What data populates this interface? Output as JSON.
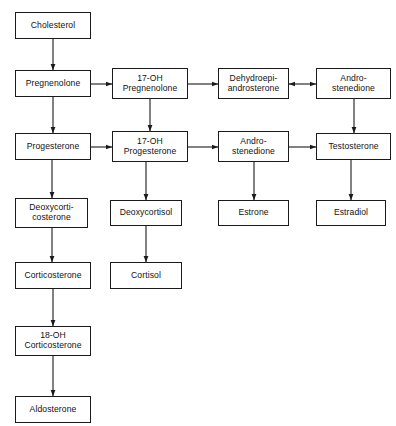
{
  "diagram": {
    "type": "flowchart",
    "canvas": {
      "width": 396,
      "height": 426
    },
    "style": {
      "background": "#ffffff",
      "box_border": "#1a1a1a",
      "box_fill": "#ffffff",
      "text_color": "#111111",
      "arrow_color": "#1a1a1a"
    },
    "nodes": [
      {
        "id": "cholesterol",
        "label": "Cholesterol",
        "x": 15,
        "y": 12,
        "w": 76,
        "h": 27
      },
      {
        "id": "pregnenolone",
        "label": "Pregnenolone",
        "x": 15,
        "y": 70,
        "w": 76,
        "h": 27
      },
      {
        "id": "oh17_pregnenolone",
        "label": "17-OH\nPregnenolone",
        "x": 112,
        "y": 68,
        "w": 76,
        "h": 31
      },
      {
        "id": "dhea",
        "label": "Dehydroepi-\nandrosterone",
        "x": 218,
        "y": 68,
        "w": 71,
        "h": 31
      },
      {
        "id": "androstenedione_top",
        "label": "Andro-\nstenedione",
        "x": 316,
        "y": 68,
        "w": 75,
        "h": 31
      },
      {
        "id": "progesterone",
        "label": "Progesterone",
        "x": 15,
        "y": 133,
        "w": 76,
        "h": 27
      },
      {
        "id": "oh17_progesterone",
        "label": "17-OH\nProgesterone",
        "x": 112,
        "y": 131,
        "w": 76,
        "h": 31
      },
      {
        "id": "androstenedione_mid",
        "label": "Andro-\nstenedione",
        "x": 218,
        "y": 131,
        "w": 71,
        "h": 31
      },
      {
        "id": "testosterone",
        "label": "Testosterone",
        "x": 316,
        "y": 133,
        "w": 75,
        "h": 27
      },
      {
        "id": "deoxycorticosterone",
        "label": "Deoxycorti-\ncosterone",
        "x": 15,
        "y": 198,
        "w": 73,
        "h": 30
      },
      {
        "id": "deoxycortisol",
        "label": "Deoxycortisol",
        "x": 110,
        "y": 200,
        "w": 72,
        "h": 26
      },
      {
        "id": "estrone",
        "label": "Estrone",
        "x": 218,
        "y": 200,
        "w": 71,
        "h": 26
      },
      {
        "id": "estradiol",
        "label": "Estradiol",
        "x": 316,
        "y": 200,
        "w": 70,
        "h": 26
      },
      {
        "id": "corticosterone",
        "label": "Corticosterone",
        "x": 15,
        "y": 262,
        "w": 76,
        "h": 27
      },
      {
        "id": "cortisol",
        "label": "Cortisol",
        "x": 110,
        "y": 262,
        "w": 72,
        "h": 27
      },
      {
        "id": "oh18_corticosterone",
        "label": "18-OH\nCorticosterone",
        "x": 15,
        "y": 326,
        "w": 76,
        "h": 30
      },
      {
        "id": "aldosterone",
        "label": "Aldosterone",
        "x": 15,
        "y": 396,
        "w": 76,
        "h": 27
      }
    ],
    "edges": [
      {
        "id": "e-chol-preg",
        "from": "cholesterol",
        "to": "pregnenolone",
        "direction": "down",
        "bidirectional": false
      },
      {
        "id": "e-preg-prog",
        "from": "pregnenolone",
        "to": "progesterone",
        "direction": "down",
        "bidirectional": false
      },
      {
        "id": "e-preg-17ohpreg",
        "from": "pregnenolone",
        "to": "oh17_pregnenolone",
        "direction": "right",
        "bidirectional": false
      },
      {
        "id": "e-17ohpreg-dhea",
        "from": "oh17_pregnenolone",
        "to": "dhea",
        "direction": "right",
        "bidirectional": false
      },
      {
        "id": "e-dhea-andro",
        "from": "dhea",
        "to": "androstenedione_top",
        "direction": "right",
        "bidirectional": true
      },
      {
        "id": "e-17ohpreg-17ohprog",
        "from": "oh17_pregnenolone",
        "to": "oh17_progesterone",
        "direction": "down",
        "bidirectional": false
      },
      {
        "id": "e-androtop-testo",
        "from": "androstenedione_top",
        "to": "testosterone",
        "direction": "down",
        "bidirectional": false
      },
      {
        "id": "e-prog-17ohprog",
        "from": "progesterone",
        "to": "oh17_progesterone",
        "direction": "right",
        "bidirectional": false
      },
      {
        "id": "e-17ohprog-andromid",
        "from": "oh17_progesterone",
        "to": "androstenedione_mid",
        "direction": "right",
        "bidirectional": false
      },
      {
        "id": "e-andromid-testo",
        "from": "androstenedione_mid",
        "to": "testosterone",
        "direction": "right",
        "bidirectional": false
      },
      {
        "id": "e-prog-doc",
        "from": "progesterone",
        "to": "deoxycorticosterone",
        "direction": "down",
        "bidirectional": false
      },
      {
        "id": "e-17ohprog-dc",
        "from": "oh17_progesterone",
        "to": "deoxycortisol",
        "direction": "down",
        "bidirectional": false
      },
      {
        "id": "e-andromid-estrone",
        "from": "androstenedione_mid",
        "to": "estrone",
        "direction": "down",
        "bidirectional": false
      },
      {
        "id": "e-testo-estradiol",
        "from": "testosterone",
        "to": "estradiol",
        "direction": "down",
        "bidirectional": false
      },
      {
        "id": "e-doc-cortico",
        "from": "deoxycorticosterone",
        "to": "corticosterone",
        "direction": "down",
        "bidirectional": false
      },
      {
        "id": "e-dc-cortisol",
        "from": "deoxycortisol",
        "to": "cortisol",
        "direction": "down",
        "bidirectional": false
      },
      {
        "id": "e-cortico-18oh",
        "from": "corticosterone",
        "to": "oh18_corticosterone",
        "direction": "down",
        "bidirectional": false
      },
      {
        "id": "e-18oh-aldo",
        "from": "oh18_corticosterone",
        "to": "aldosterone",
        "direction": "down",
        "bidirectional": false
      }
    ]
  }
}
